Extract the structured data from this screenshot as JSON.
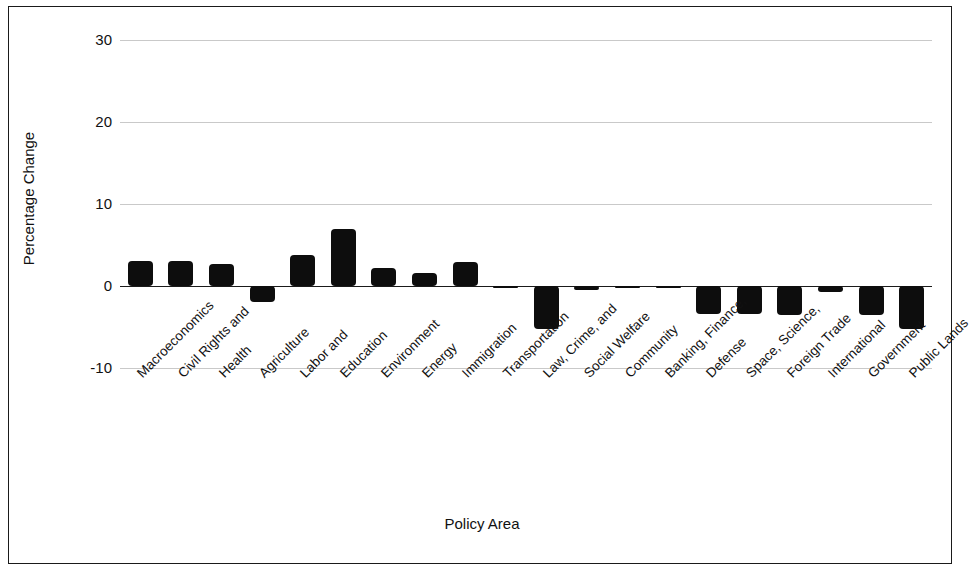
{
  "chart_data": {
    "type": "bar",
    "title": "",
    "xlabel": "Policy Area",
    "ylabel": "Percentage Change",
    "ylim": [
      -10,
      30
    ],
    "yticks": [
      30,
      20,
      10,
      0,
      -10
    ],
    "grid": true,
    "legend": "none",
    "bar_color": "#0d0d0d",
    "categories": [
      "Macroeconomics",
      "Civil Rights and",
      "Health",
      "Agriculture",
      "Labor and",
      "Education",
      "Environment",
      "Energy",
      "Immigration",
      "Transportation",
      "Law, Crime, and",
      "Social Welfare",
      "Community",
      "Banking, Finance,",
      "Defense",
      "Space, Science,",
      "Foreign Trade",
      "International",
      "Government",
      "Public Lands"
    ],
    "values": [
      3.0,
      3.0,
      2.7,
      -1.9,
      3.8,
      6.9,
      2.2,
      1.6,
      2.9,
      -0.3,
      -5.2,
      -0.5,
      -0.1,
      0.0,
      -3.4,
      -3.4,
      -3.5,
      -0.7,
      -3.5,
      -5.2
    ]
  },
  "axes": {
    "y_title": "Percentage Change",
    "x_title": "Policy Area",
    "y_tick_labels": [
      "30",
      "20",
      "10",
      "0",
      "-10"
    ]
  }
}
